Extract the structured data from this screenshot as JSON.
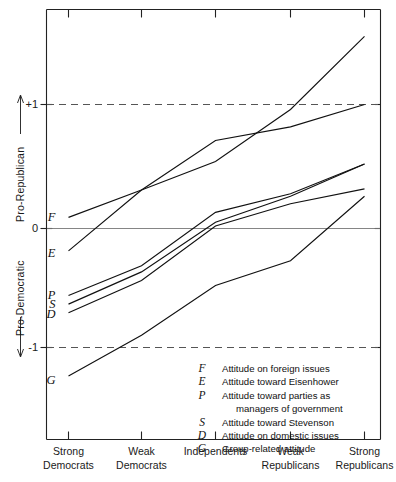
{
  "chart_data": {
    "type": "line",
    "title": "",
    "xlabel": "",
    "ylabel_upper": "Pro-Republican",
    "ylabel_lower": "Pro-Democratic",
    "categories": [
      "Strong Democrats",
      "Weak Democrats",
      "Independents",
      "Weak Republicans",
      "Strong Republicans"
    ],
    "category_lines": [
      [
        "Strong",
        "Democrats"
      ],
      [
        "Weak",
        "Democrats"
      ],
      [
        "Independents",
        ""
      ],
      [
        "Weak",
        "Republicans"
      ],
      [
        "Strong",
        "Republicans"
      ]
    ],
    "ylim": [
      -1.45,
      1.55
    ],
    "ytick_values": [
      1,
      0,
      -1
    ],
    "ytick_labels": [
      "+1",
      "0",
      "-1"
    ],
    "grid": false,
    "reference_lines": [
      1,
      -1
    ],
    "zero_line": 0,
    "legend_position": "inside-bottom-right",
    "series": [
      {
        "name": "F",
        "label": "Attitude on foreign issues",
        "values": [
          0.09,
          0.31,
          0.54,
          0.96,
          1.55
        ]
      },
      {
        "name": "E",
        "label": "Attitude toward Eisenhower",
        "values": [
          -0.18,
          0.31,
          0.71,
          0.82,
          1.0
        ]
      },
      {
        "name": "P",
        "label": "Attitude toward parties as managers of government",
        "values": [
          -0.54,
          -0.3,
          0.13,
          0.28,
          0.52
        ]
      },
      {
        "name": "S",
        "label": "Attitude toward Stevenson",
        "values": [
          -0.61,
          -0.35,
          0.05,
          0.26,
          0.52
        ]
      },
      {
        "name": "D",
        "label": "Attitude on domestic issues",
        "values": [
          -0.68,
          -0.42,
          0.02,
          0.2,
          0.32
        ]
      },
      {
        "name": "G",
        "label": "Group-related attitude",
        "values": [
          -1.19,
          -0.86,
          -0.46,
          -0.26,
          0.26
        ]
      }
    ],
    "legend": [
      {
        "key": "F",
        "lines": [
          "Attitude on foreign issues"
        ]
      },
      {
        "key": "E",
        "lines": [
          "Attitude toward Eisenhower"
        ]
      },
      {
        "key": "P",
        "lines": [
          "Attitude toward parties as",
          "managers of government"
        ]
      },
      {
        "key": "S",
        "lines": [
          "Attitude toward Stevenson"
        ]
      },
      {
        "key": "D",
        "lines": [
          "Attitude on domestic issues"
        ]
      },
      {
        "key": "G",
        "lines": [
          "Group-related attitude"
        ]
      }
    ],
    "series_inline_labels": [
      "F",
      "E",
      "P",
      "S",
      "D",
      "G"
    ],
    "colors": {
      "line": "#111111",
      "axis": "#222222",
      "reference": "#555555"
    }
  }
}
